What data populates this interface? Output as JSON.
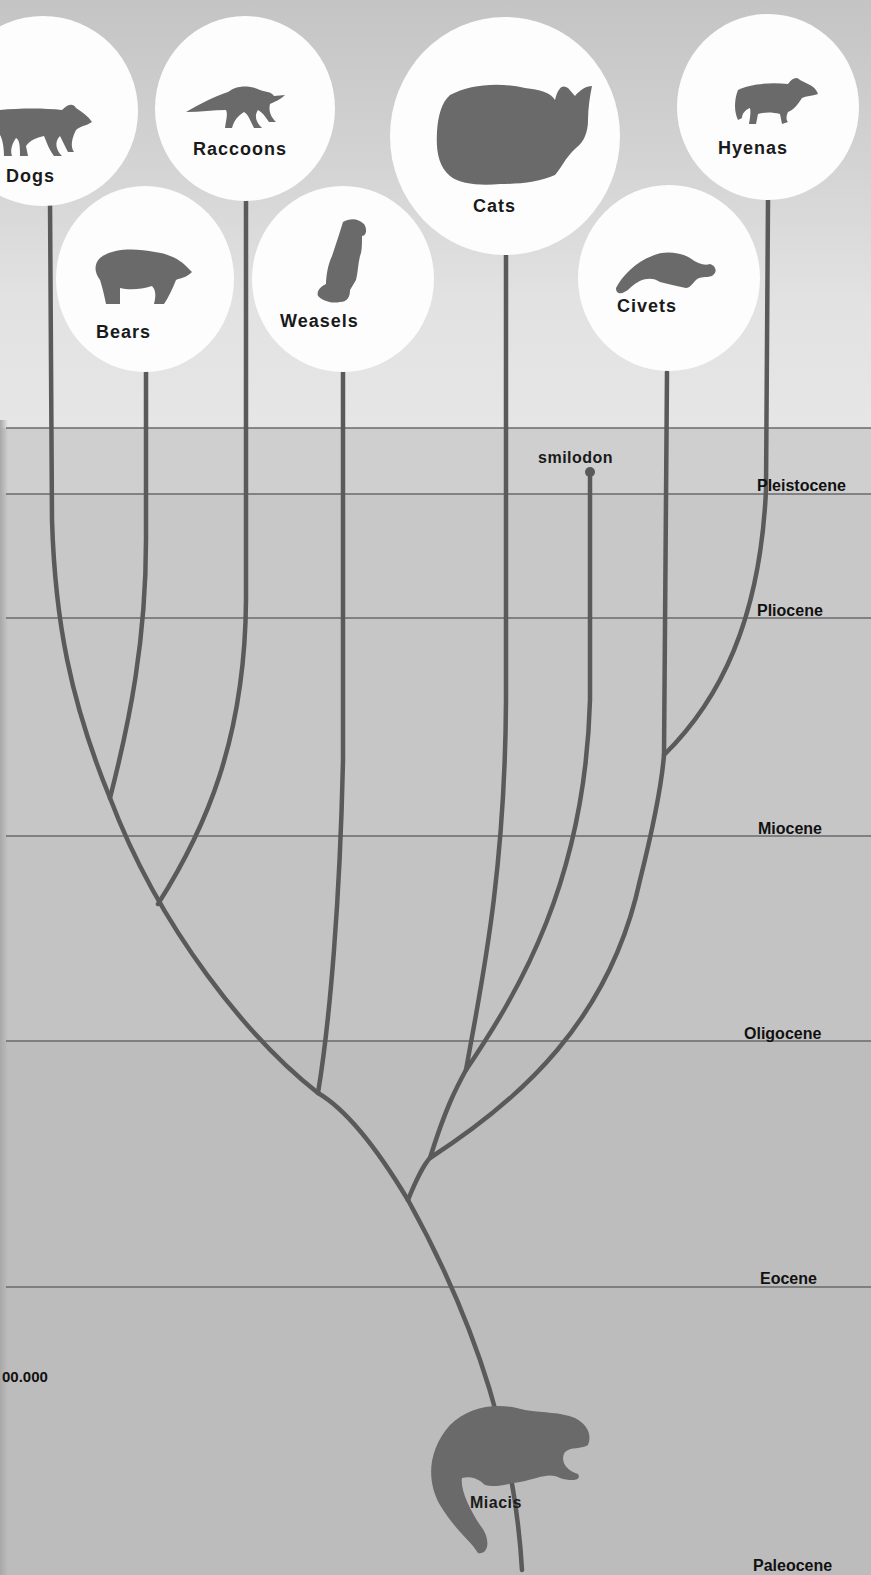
{
  "diagram": {
    "type": "phylogenetic-tree",
    "colors": {
      "branch": "#5a5a5a",
      "silhouette": "#6a6a6a",
      "circle": "#fdfdfd",
      "text": "#111111",
      "epoch_line": "#6a6a6a"
    },
    "groups": [
      {
        "label": "Dogs",
        "icon": "dog-silhouette-icon"
      },
      {
        "label": "Bears",
        "icon": "bear-silhouette-icon"
      },
      {
        "label": "Raccoons",
        "icon": "raccoon-silhouette-icon"
      },
      {
        "label": "Weasels",
        "icon": "weasel-silhouette-icon"
      },
      {
        "label": "Cats",
        "icon": "cat-silhouette-icon"
      },
      {
        "label": "Civets",
        "icon": "civet-silhouette-icon"
      },
      {
        "label": "Hyenas",
        "icon": "hyena-silhouette-icon"
      }
    ],
    "extinct_branch": {
      "label": "smilodon"
    },
    "ancestor": {
      "label": "Miacis",
      "icon": "miacis-silhouette-icon"
    },
    "epochs": [
      {
        "label": "Pleistocene"
      },
      {
        "label": "Pliocene"
      },
      {
        "label": "Miocene"
      },
      {
        "label": "Oligocene"
      },
      {
        "label": "Eocene"
      },
      {
        "label": "Paleocene"
      }
    ],
    "age_marker": "00.000"
  }
}
